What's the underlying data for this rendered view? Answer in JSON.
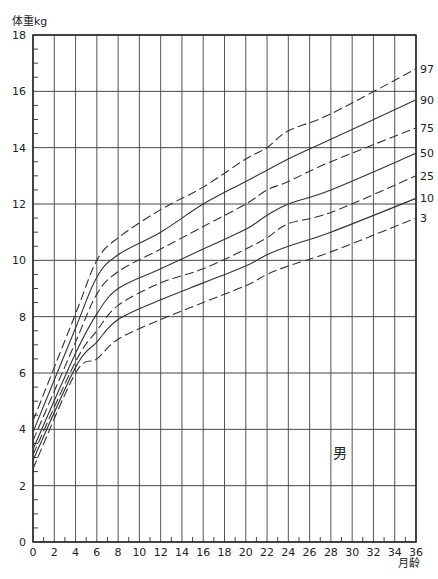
{
  "chart_data": {
    "type": "line",
    "title": "",
    "xlabel": "月龄",
    "ylabel": "体重kg",
    "annotation": "男",
    "xlim": [
      0,
      36
    ],
    "ylim": [
      0,
      18
    ],
    "grid": true,
    "x_ticks": [
      0,
      2,
      4,
      6,
      8,
      10,
      12,
      14,
      16,
      18,
      20,
      22,
      24,
      26,
      28,
      30,
      32,
      34,
      36
    ],
    "y_ticks": [
      0,
      2,
      4,
      6,
      8,
      10,
      12,
      14,
      16,
      18
    ],
    "x": [
      0,
      4,
      6,
      8,
      12,
      16,
      20,
      22,
      24,
      28,
      36
    ],
    "series": [
      {
        "name": "97",
        "style": "dashed",
        "values": [
          4.3,
          8.1,
          10.0,
          10.8,
          11.8,
          12.6,
          13.6,
          14.0,
          14.6,
          15.2,
          16.8
        ]
      },
      {
        "name": "90",
        "style": "solid",
        "values": [
          3.9,
          7.6,
          9.4,
          10.2,
          11.0,
          12.0,
          12.8,
          13.2,
          13.6,
          14.3,
          15.7
        ]
      },
      {
        "name": "75",
        "style": "dashed",
        "values": [
          3.6,
          7.1,
          8.8,
          9.6,
          10.4,
          11.2,
          12.0,
          12.5,
          12.8,
          13.5,
          14.7
        ]
      },
      {
        "name": "50",
        "style": "solid",
        "values": [
          3.3,
          6.7,
          8.1,
          9.0,
          9.7,
          10.4,
          11.1,
          11.6,
          12.0,
          12.5,
          13.8
        ]
      },
      {
        "name": "25",
        "style": "dashed",
        "values": [
          3.1,
          6.4,
          7.5,
          8.4,
          9.2,
          9.7,
          10.4,
          10.8,
          11.3,
          11.7,
          13.0
        ]
      },
      {
        "name": "10",
        "style": "solid",
        "values": [
          2.9,
          6.2,
          7.1,
          7.9,
          8.6,
          9.2,
          9.8,
          10.2,
          10.5,
          11.0,
          12.2
        ]
      },
      {
        "name": "3",
        "style": "dashed",
        "values": [
          2.6,
          6.0,
          6.5,
          7.2,
          7.9,
          8.5,
          9.1,
          9.5,
          9.8,
          10.3,
          11.5
        ]
      }
    ]
  },
  "labels": {
    "y_axis_title": "体重kg",
    "x_axis_title": "月龄",
    "sex": "男"
  }
}
